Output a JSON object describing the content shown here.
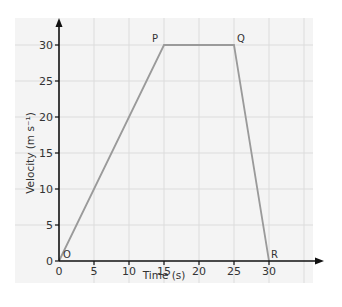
{
  "chart_data": {
    "type": "line",
    "title": "",
    "xlabel": "Time (s)",
    "ylabel": "Velocity (m s⁻¹)",
    "xlim": [
      0,
      35
    ],
    "ylim": [
      0,
      30
    ],
    "grid": true,
    "legend": null,
    "x_ticks": [
      0,
      5,
      10,
      15,
      20,
      25,
      30
    ],
    "y_ticks": [
      0,
      5,
      10,
      15,
      20,
      25,
      30
    ],
    "series": [
      {
        "name": "velocity-time",
        "color": "#9a9a9a",
        "x": [
          0,
          15,
          25,
          30
        ],
        "y": [
          0,
          30,
          30,
          0
        ]
      }
    ],
    "annotations": [
      {
        "label": "O",
        "x": 0,
        "y": 0
      },
      {
        "label": "P",
        "x": 15,
        "y": 30
      },
      {
        "label": "Q",
        "x": 25,
        "y": 30
      },
      {
        "label": "R",
        "x": 30,
        "y": 0
      }
    ]
  },
  "colors": {
    "panel_bg": "#f4f4f4",
    "grid": "#dcdcdc",
    "axis": "#111111",
    "line": "#9a9a9a"
  }
}
